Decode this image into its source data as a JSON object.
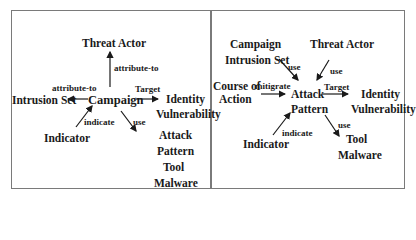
{
  "left_diagram": {
    "center": "Campaign",
    "nodes": {
      "threat_actor": "Threat Actor",
      "intrusion_set": "Intrusion Set",
      "identity": "Identity",
      "vulnerability": "Vulnerability",
      "indicator": "Indicator",
      "attack": "Attack",
      "pattern": "Pattern",
      "tool": "Tool",
      "malware": "Malware"
    },
    "edges": {
      "to_threat_actor": "attribute-to",
      "to_intrusion_set": "attribute-to",
      "target": "Target",
      "indicate": "indicate",
      "use": "use"
    }
  },
  "right_diagram": {
    "center_line1": "Attack",
    "center_line2": "Pattern",
    "nodes": {
      "campaign": "Campaign",
      "intrusion_set": "Intrusion Set",
      "threat_actor": "Threat Actor",
      "course_of_action_1": "Course of",
      "course_of_action_2": "Action",
      "identity": "Identity",
      "vulnerability": "Vulnerability",
      "indicator": "Indicator",
      "tool": "Tool",
      "malware": "Malware"
    },
    "edges": {
      "use_left": "use",
      "use_right": "use",
      "mitigrate": "mitigrate",
      "target": "Target",
      "indicate": "indicate",
      "use_down": "use"
    }
  }
}
